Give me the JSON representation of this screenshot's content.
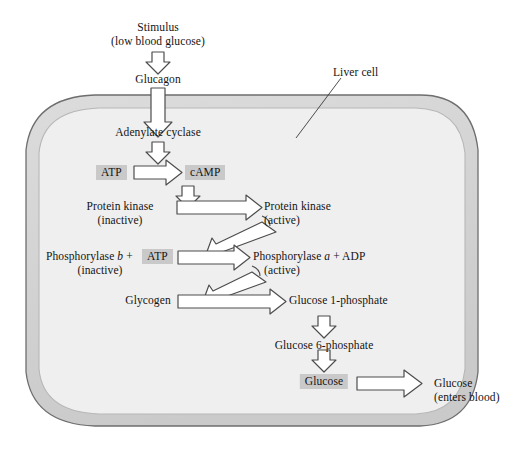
{
  "diagram": {
    "type": "biochemical-pathway",
    "background_color": "#ffffff",
    "cell": {
      "label": "Liver cell",
      "membrane_color": "#d2d2d2",
      "membrane_outline": "#6e6e6e",
      "cytoplasm_color": "#efefef",
      "cytoplasm_outline": "#b4b4b4"
    },
    "highlight_color": "#c9c9c9",
    "arrow_fill": "#ffffff",
    "arrow_outline": "#4d4d4d",
    "extracellular": {
      "stimulus_line1": "Stimulus",
      "stimulus_line2": "(low blood glucose)",
      "hormone": "Glucagon",
      "output_line1": "Glucose",
      "output_line2": "(enters blood)"
    },
    "steps": {
      "adenylate_cyclase": "Adenylate cyclase",
      "atp_1": "ATP",
      "camp": "cAMP",
      "protein_kinase_inactive_l1": "Protein kinase",
      "protein_kinase_inactive_l2": "(inactive)",
      "protein_kinase_active_l1": "Protein kinase",
      "protein_kinase_active_l2": "(active)",
      "phosphorylase_b_pre": "Phosphorylase ",
      "phosphorylase_b_italic": "b",
      "phosphorylase_b_post": " +",
      "phosphorylase_b_inactive": "(inactive)",
      "atp_2": "ATP",
      "phosphorylase_a_pre": "Phosphorylase ",
      "phosphorylase_a_italic": "a",
      "phosphorylase_a_post": " + ADP",
      "phosphorylase_a_active": "(active)",
      "glycogen": "Glycogen",
      "glucose_1_phosphate": "Glucose 1-phosphate",
      "glucose_6_phosphate": "Glucose 6-phosphate",
      "glucose_intracellular": "Glucose"
    }
  }
}
